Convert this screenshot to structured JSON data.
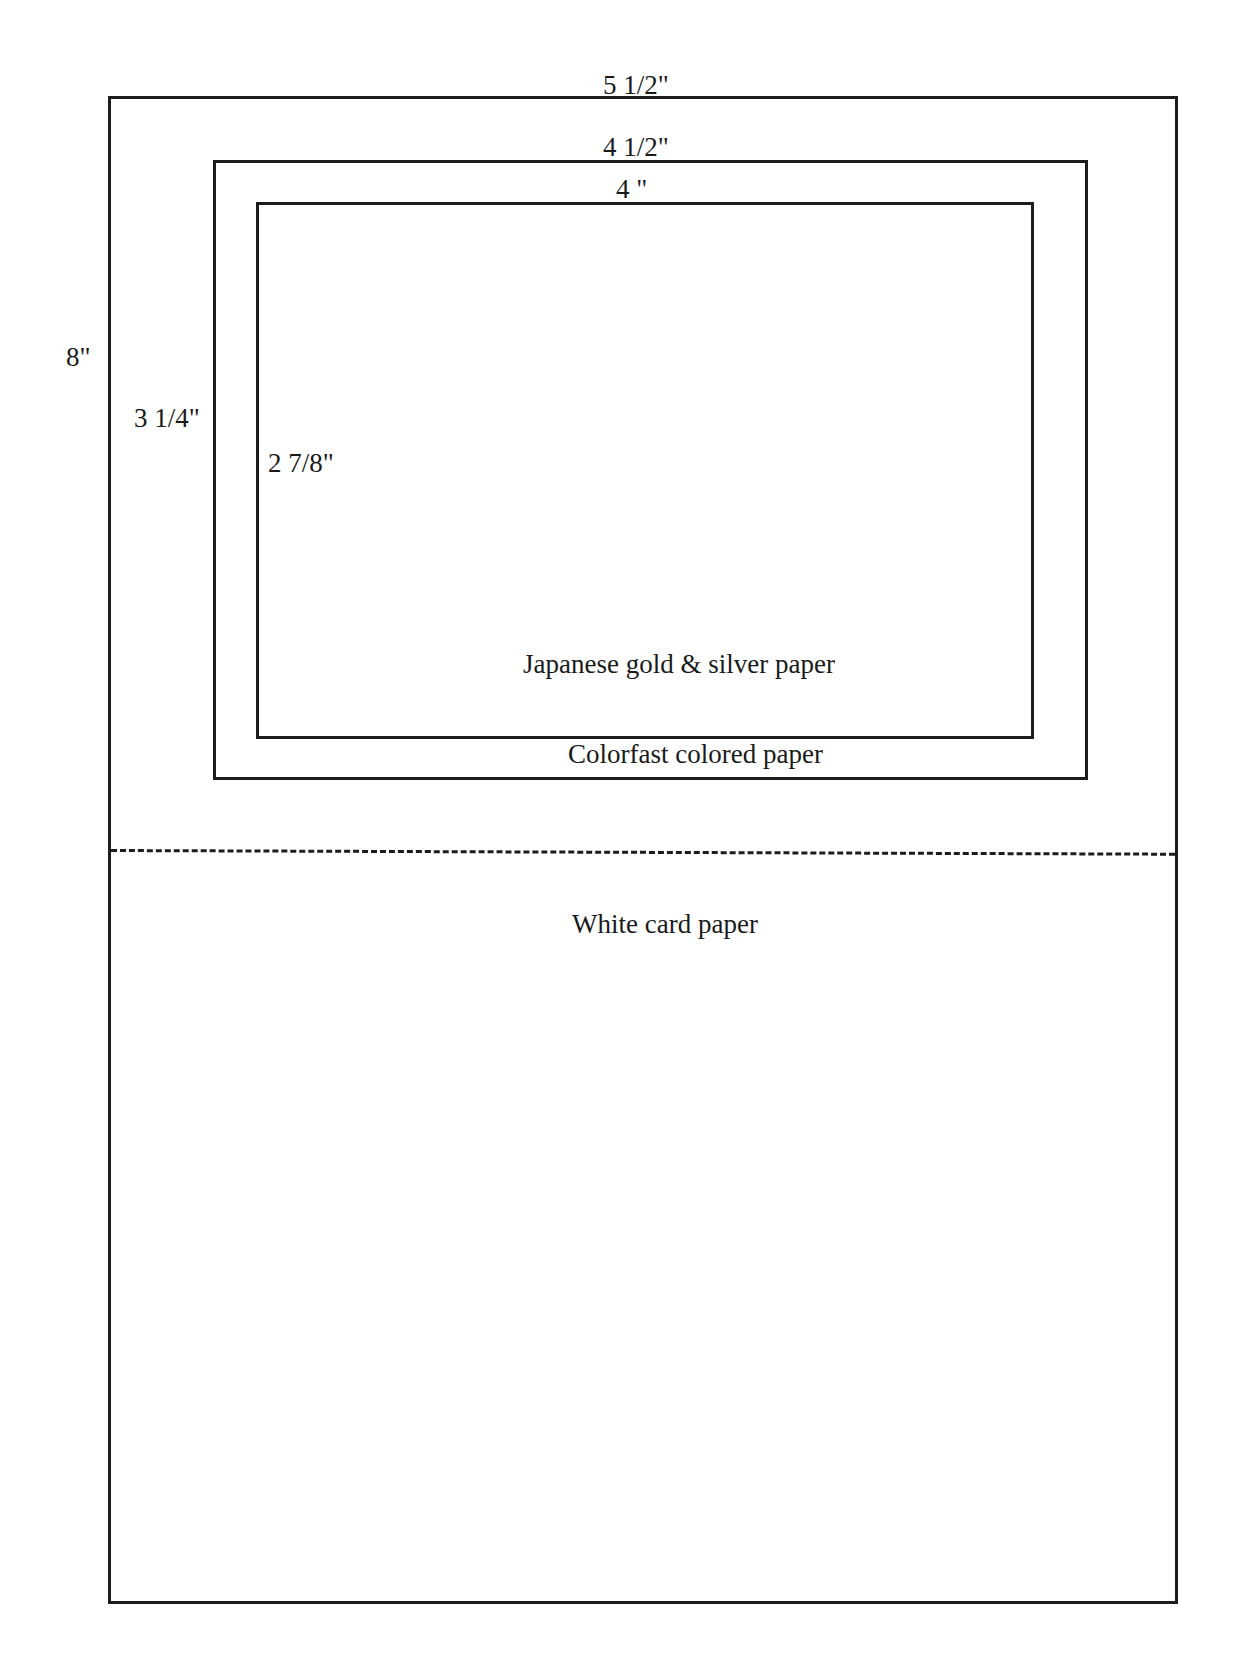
{
  "diagram": {
    "type": "card layout template",
    "colors": {
      "line": "#1c1c1c",
      "background": "#ffffff",
      "text": "#1a1a1a"
    },
    "layers": [
      {
        "id": "outer",
        "material": "White card paper",
        "width_label": "5 1/2\"",
        "height_label": "8\""
      },
      {
        "id": "middle",
        "material": "Colorfast colored paper",
        "width_label": "4 1/2\"",
        "height_label": "3 1/4\""
      },
      {
        "id": "inner",
        "material": "Japanese gold & silver paper",
        "width_label": "4 \"",
        "height_label": "2 7/8\""
      }
    ],
    "fold_line": {
      "style": "dashed",
      "position": "horizontal, mid-card"
    }
  }
}
